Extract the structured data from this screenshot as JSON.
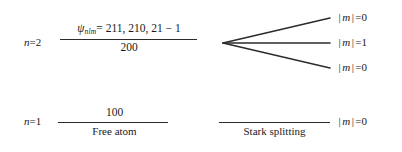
{
  "figure": {
    "type": "energy-level-diagram",
    "line_color": "#2b2b2b",
    "background": "#ffffff"
  },
  "free_atom": {
    "caption": "Free atom",
    "levels": [
      {
        "principal_label_n": "n",
        "principal_label_eq": "=",
        "principal_label_value": "2",
        "numerator_psi": "ψ",
        "numerator_psi_sub": "nlm",
        "numerator_rest": "= 211, 210, 21 − 1",
        "denominator": "200"
      },
      {
        "principal_label_n": "n",
        "principal_label_eq": "=",
        "principal_label_value": "1",
        "state": "100"
      }
    ]
  },
  "stark": {
    "caption": "Stark splitting",
    "split_levels": [
      {
        "m_sym": "m",
        "bar": "|",
        "eq": "=",
        "value": "0"
      },
      {
        "m_sym": "m",
        "bar": "|",
        "eq": "=",
        "value": "1"
      },
      {
        "m_sym": "m",
        "bar": "|",
        "eq": "=",
        "value": "0"
      }
    ],
    "ground_level": {
      "m_sym": "m",
      "bar": "|",
      "eq": "=",
      "value": "0"
    }
  }
}
